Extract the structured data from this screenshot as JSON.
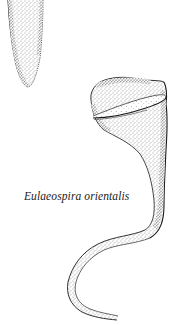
{
  "plate": {
    "caption": "Eulaeospira orientalis",
    "colors": {
      "background": "#ffffff",
      "ink": "#1a1a1a",
      "stipple": "#3a3a3a"
    },
    "figures": [
      {
        "name": "partial-lorica-top-left",
        "description": "tapered end of an elongated stippled lorica cut off at top edge"
      },
      {
        "name": "eulaeospira-lorica",
        "description": "bowl-shaped oral region with ring collar tapering into a long S-curved stippled tail"
      }
    ]
  }
}
